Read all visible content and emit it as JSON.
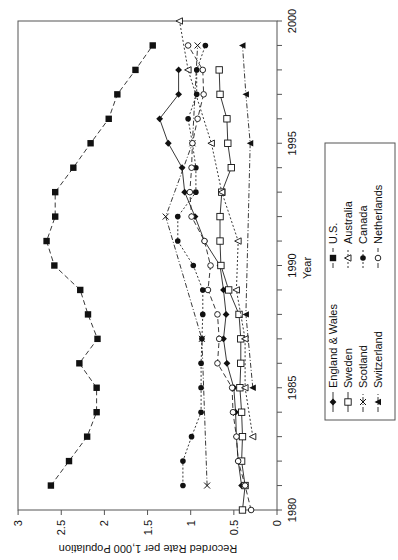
{
  "chart_data": {
    "type": "line",
    "orientation": "rotated-90-ccw",
    "title": "",
    "xlabel": "Year",
    "ylabel": "Recorded Rate per 1,000 Population",
    "xlim": [
      1980,
      2000
    ],
    "ylim": [
      0,
      3
    ],
    "x_ticks": [
      1980,
      1985,
      1990,
      1995,
      2000
    ],
    "y_ticks": [
      0,
      0.5,
      1,
      1.5,
      2,
      2.5,
      3
    ],
    "y_tick_labels": [
      "0",
      "0.5",
      "1",
      "1.5",
      "2",
      "2.5",
      "3"
    ],
    "grid": false,
    "legend_position": "right (bottom in rotated view)",
    "series": [
      {
        "name": "England & Wales",
        "marker": "diamond-filled",
        "line": "solid",
        "points": [
          [
            1981,
            0.41
          ],
          [
            1982,
            0.45
          ],
          [
            1983,
            0.47
          ],
          [
            1984,
            0.48
          ],
          [
            1985,
            0.5
          ],
          [
            1986,
            0.58
          ],
          [
            1987,
            0.62
          ],
          [
            1988,
            0.59
          ],
          [
            1989,
            0.62
          ],
          [
            1990,
            0.66
          ],
          [
            1991,
            0.84
          ],
          [
            1992,
            0.95
          ],
          [
            1993,
            1.07
          ],
          [
            1994,
            1.1
          ],
          [
            1995,
            1.26
          ],
          [
            1996,
            1.36
          ],
          [
            1997,
            1.14
          ],
          [
            1998,
            1.14
          ]
        ]
      },
      {
        "name": "Sweden",
        "marker": "square-open",
        "line": "solid",
        "points": [
          [
            1980,
            0.4
          ],
          [
            1981,
            0.37
          ],
          [
            1982,
            0.41
          ],
          [
            1983,
            0.4
          ],
          [
            1984,
            0.41
          ],
          [
            1985,
            0.43
          ],
          [
            1986,
            0.42
          ],
          [
            1987,
            0.42
          ],
          [
            1988,
            0.44
          ],
          [
            1989,
            0.56
          ],
          [
            1990,
            0.65
          ],
          [
            1991,
            0.66
          ],
          [
            1992,
            0.66
          ],
          [
            1993,
            0.64
          ],
          [
            1994,
            0.53
          ],
          [
            1995,
            0.57
          ],
          [
            1996,
            0.58
          ],
          [
            1997,
            0.66
          ],
          [
            1998,
            0.67
          ]
        ]
      },
      {
        "name": "Scotland",
        "marker": "x",
        "line": "dash-dot",
        "points": [
          [
            1981,
            0.81
          ],
          [
            1987,
            0.87
          ],
          [
            1992,
            1.29
          ],
          [
            1995,
            0.98
          ],
          [
            1999,
            0.92
          ]
        ]
      },
      {
        "name": "Switzerland",
        "marker": "triangle-filled",
        "line": "dash-dot",
        "points": [
          [
            1985,
            0.28
          ],
          [
            1988,
            0.36
          ],
          [
            1995,
            0.31
          ],
          [
            1997,
            0.36
          ],
          [
            1999,
            0.4
          ]
        ]
      },
      {
        "name": "U.S.",
        "marker": "square-filled",
        "line": "dashed",
        "points": [
          [
            1981,
            2.62
          ],
          [
            1982,
            2.41
          ],
          [
            1983,
            2.2
          ],
          [
            1984,
            2.09
          ],
          [
            1985,
            2.09
          ],
          [
            1986,
            2.29
          ],
          [
            1987,
            2.08
          ],
          [
            1988,
            2.19
          ],
          [
            1989,
            2.28
          ],
          [
            1990,
            2.58
          ],
          [
            1991,
            2.67
          ],
          [
            1992,
            2.57
          ],
          [
            1993,
            2.57
          ],
          [
            1994,
            2.36
          ],
          [
            1995,
            2.16
          ],
          [
            1996,
            1.95
          ],
          [
            1997,
            1.85
          ],
          [
            1998,
            1.64
          ],
          [
            1999,
            1.44
          ]
        ]
      },
      {
        "name": "Australia",
        "marker": "triangle-open",
        "line": "dotted",
        "points": [
          [
            1983,
            0.28
          ],
          [
            1985,
            0.37
          ],
          [
            1987,
            0.37
          ],
          [
            1989,
            0.47
          ],
          [
            1991,
            0.45
          ],
          [
            1993,
            0.64
          ],
          [
            1995,
            0.76
          ],
          [
            1998,
            1.03
          ],
          [
            2000,
            1.13
          ]
        ]
      },
      {
        "name": "Canada",
        "marker": "circle-filled",
        "line": "dotted",
        "points": [
          [
            1981,
            1.09
          ],
          [
            1982,
            1.09
          ],
          [
            1983,
            0.99
          ],
          [
            1984,
            0.88
          ],
          [
            1985,
            0.88
          ],
          [
            1986,
            0.88
          ],
          [
            1987,
            0.87
          ],
          [
            1988,
            0.86
          ],
          [
            1989,
            0.86
          ],
          [
            1990,
            0.97
          ],
          [
            1991,
            1.15
          ],
          [
            1992,
            1.15
          ],
          [
            1993,
            0.94
          ],
          [
            1994,
            0.94
          ],
          [
            1995,
            0.98
          ],
          [
            1996,
            1.03
          ],
          [
            1997,
            0.93
          ],
          [
            1998,
            0.93
          ],
          [
            1999,
            0.83
          ]
        ]
      },
      {
        "name": "Netherlands",
        "marker": "circle-open",
        "line": "dashed",
        "points": [
          [
            1980,
            0.3
          ],
          [
            1981,
            0.37
          ],
          [
            1982,
            0.45
          ],
          [
            1983,
            0.47
          ],
          [
            1984,
            0.51
          ],
          [
            1985,
            0.52
          ],
          [
            1986,
            0.69
          ],
          [
            1987,
            0.67
          ],
          [
            1988,
            0.69
          ],
          [
            1989,
            0.8
          ],
          [
            1990,
            0.77
          ],
          [
            1991,
            0.84
          ],
          [
            1992,
            0.99
          ],
          [
            1993,
            1.01
          ],
          [
            1994,
            0.99
          ],
          [
            1995,
            0.98
          ],
          [
            1996,
            0.92
          ],
          [
            1997,
            0.85
          ],
          [
            1998,
            0.86
          ],
          [
            1999,
            1.03
          ]
        ]
      }
    ]
  },
  "legend": {
    "items": [
      {
        "label": "England & Wales"
      },
      {
        "label": "Sweden"
      },
      {
        "label": "Scotland"
      },
      {
        "label": "Switzerland"
      },
      {
        "label": "U.S."
      },
      {
        "label": "Australia"
      },
      {
        "label": "Canada"
      },
      {
        "label": "Netherlands"
      }
    ]
  },
  "axes": {
    "xlabel": "Year",
    "ylabel": "Recorded Rate per 1,000 Population"
  }
}
